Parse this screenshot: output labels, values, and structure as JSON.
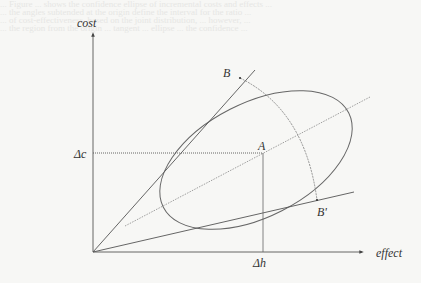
{
  "bleed_through_lines": [
    "... Figure ... shows the confidence ellipse of incremental costs and effects ...",
    "... the angles subtended at the origin define the interval for the ratio ...",
    "... of cost-effectiveness, based on the joint distribution, ... however, ...",
    "... the region from the origin ... tangent ... ellipse ... the confidence ..."
  ],
  "diagram": {
    "axes": {
      "y_label": "cost",
      "x_label": "effect"
    },
    "point_labels": {
      "A": "A",
      "B": "B",
      "B_prime": "B'"
    },
    "tick_labels": {
      "delta_c": "Δc",
      "delta_h": "Δh"
    },
    "colors": {
      "line": "#555555",
      "text": "#333333",
      "background": "#f7f7f5"
    }
  }
}
